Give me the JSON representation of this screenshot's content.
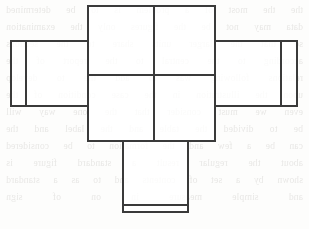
{
  "page": {
    "width": 309,
    "height": 229,
    "background_color": "#fdfdfc",
    "ink_color": "#3a3a3a",
    "bleed_text_color": "#b9b6b2"
  },
  "bleed_through_text": {
    "note": "Illegible mirrored show-through from the reverse side of the scanned page; rendered as faint ghost lines.",
    "lines": [
      "the the most of a problem is to be determined",
      "data may not be the figures only the examination",
      "so that the larger units share to the sections",
      "according to the central to the report of the",
      "relations following was to add the to develop",
      "upon the illustration in the case condition of the",
      "even we must consider that the one way will",
      "be to divided the table and the label and the",
      "can be a few and the formation to be considered",
      "about the regular result a standard figure is",
      "shown by a set of contents and to as a standard",
      "and simple measure in on of sign"
    ]
  },
  "diagram": {
    "type": "line-drawing",
    "stroke_width": 2,
    "panels": [
      {
        "name": "center-top-left-panel",
        "x": 88,
        "y": 6,
        "width": 66,
        "height": 69
      },
      {
        "name": "center-top-right-panel",
        "x": 154,
        "y": 6,
        "width": 61,
        "height": 69
      },
      {
        "name": "center-bottom-left-panel",
        "x": 88,
        "y": 75,
        "width": 66,
        "height": 66
      },
      {
        "name": "center-bottom-right-panel",
        "x": 154,
        "y": 75,
        "width": 61,
        "height": 66
      },
      {
        "name": "left-wing-outer-tab",
        "x": 11,
        "y": 41,
        "width": 15,
        "height": 65
      },
      {
        "name": "left-wing-panel",
        "x": 26,
        "y": 41,
        "width": 62,
        "height": 65
      },
      {
        "name": "right-wing-panel",
        "x": 215,
        "y": 41,
        "width": 66,
        "height": 65
      },
      {
        "name": "right-wing-outer-tab",
        "x": 281,
        "y": 41,
        "width": 16,
        "height": 65
      },
      {
        "name": "bottom-flap-panel",
        "x": 123,
        "y": 141,
        "width": 65,
        "height": 64
      },
      {
        "name": "bottom-flap-tab",
        "x": 123,
        "y": 205,
        "width": 65,
        "height": 7
      }
    ],
    "outline_path": "M 88 6 L 215 6 L 215 41 L 297 41 L 297 106 L 215 106 L 215 141 L 188 141 L 188 212 L 123 212 L 123 141 L 88 141 L 88 106 L 11 106 L 11 41 L 88 41 Z",
    "fold_lines": [
      {
        "name": "center-vertical-fold",
        "x1": 154,
        "y1": 6,
        "x2": 154,
        "y2": 141
      },
      {
        "name": "center-horizontal-fold",
        "x1": 88,
        "y1": 75,
        "x2": 215,
        "y2": 75
      },
      {
        "name": "left-wing-attach-fold",
        "x1": 88,
        "y1": 41,
        "x2": 88,
        "y2": 106
      },
      {
        "name": "left-tab-fold",
        "x1": 26,
        "y1": 41,
        "x2": 26,
        "y2": 106
      },
      {
        "name": "right-wing-attach-fold",
        "x1": 215,
        "y1": 41,
        "x2": 215,
        "y2": 106
      },
      {
        "name": "right-tab-fold",
        "x1": 281,
        "y1": 41,
        "x2": 281,
        "y2": 106
      },
      {
        "name": "bottom-flap-attach-fold",
        "x1": 123,
        "y1": 141,
        "x2": 188,
        "y2": 141
      },
      {
        "name": "bottom-tab-fold",
        "x1": 123,
        "y1": 205,
        "x2": 188,
        "y2": 205
      }
    ]
  }
}
